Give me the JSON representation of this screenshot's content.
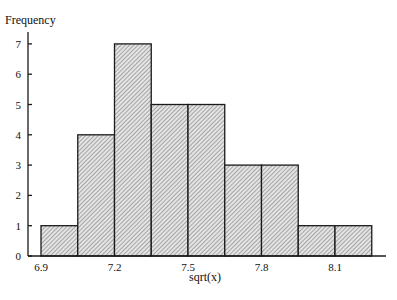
{
  "chart_data": {
    "type": "bar",
    "subtype": "histogram",
    "title": "",
    "xlabel": "sqrt(x)",
    "ylabel": "Frequency",
    "bin_edges": [
      6.9,
      7.05,
      7.2,
      7.35,
      7.5,
      7.65,
      7.8,
      7.95,
      8.1,
      8.25
    ],
    "categories": [
      "6.90-7.05",
      "7.05-7.20",
      "7.20-7.35",
      "7.35-7.50",
      "7.50-7.65",
      "7.65-7.80",
      "7.80-7.95",
      "7.95-8.10",
      "8.10-8.25"
    ],
    "values": [
      1,
      4,
      7,
      5,
      5,
      3,
      3,
      1,
      1
    ],
    "xticks": [
      "6.9",
      "7.2",
      "7.5",
      "7.8",
      "8.1"
    ],
    "xtick_values": [
      6.9,
      7.2,
      7.5,
      7.8,
      8.1
    ],
    "yticks": [
      "0",
      "1",
      "2",
      "3",
      "4",
      "5",
      "6",
      "7"
    ],
    "xlim": [
      6.9,
      8.35
    ],
    "ylim": [
      0,
      7.5
    ],
    "grid": false,
    "legend": null,
    "fill": "diagonal hatch, gray",
    "colors": {
      "bar_fill": "#cfcfcf",
      "bar_edge": "#1a1a1a",
      "axis": "#1a1a1a"
    }
  }
}
